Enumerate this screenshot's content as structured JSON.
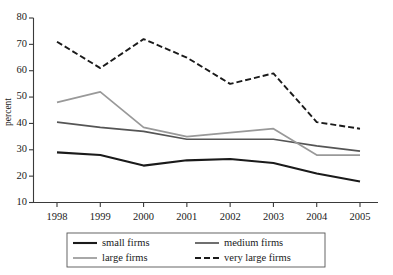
{
  "chart_data": {
    "type": "line",
    "title": "",
    "subtitle": "",
    "xlabel": "",
    "ylabel": "percent",
    "categories": [
      "1998",
      "1999",
      "2000",
      "2001",
      "2002",
      "2003",
      "2004",
      "2005"
    ],
    "x": [
      1998,
      1999,
      2000,
      2001,
      2002,
      2003,
      2004,
      2005
    ],
    "ylim": [
      10,
      80
    ],
    "yticks": [
      10,
      20,
      30,
      40,
      50,
      60,
      70,
      80
    ],
    "ytick_labels": [
      "10",
      "20",
      "30",
      "40",
      "50",
      "60",
      "70",
      "80"
    ],
    "grid": false,
    "legend_position": "bottom",
    "series": [
      {
        "name": "small firms",
        "values": [
          29,
          28,
          24,
          26,
          26.5,
          25,
          21,
          18
        ],
        "color": "#1a1a1a",
        "width": 2.1,
        "dash": "none"
      },
      {
        "name": "medium firms",
        "values": [
          40.5,
          38.5,
          37,
          34,
          34,
          34,
          31.5,
          29.5
        ],
        "color": "#555555",
        "width": 1.7,
        "dash": "none"
      },
      {
        "name": "large firms",
        "values": [
          48,
          52,
          38.5,
          35,
          36.5,
          38,
          28,
          28
        ],
        "color": "#999999",
        "width": 1.7,
        "dash": "none"
      },
      {
        "name": "very large firms",
        "values": [
          71,
          61,
          72,
          65,
          55,
          59,
          40.5,
          38
        ],
        "color": "#1a1a1a",
        "width": 1.9,
        "dash": "6,3"
      }
    ]
  },
  "legend": {
    "entries": [
      {
        "label": "small firms"
      },
      {
        "label": "medium firms"
      },
      {
        "label": "large firms"
      },
      {
        "label": "very large firms"
      }
    ]
  }
}
